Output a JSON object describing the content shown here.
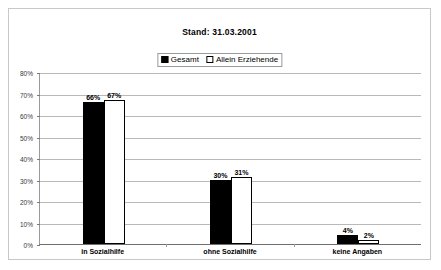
{
  "chart_data": {
    "type": "bar",
    "title": "Stand: 31.03.2001",
    "xlabel": "",
    "ylabel": "",
    "ylim": [
      0,
      80
    ],
    "ytick_labels": [
      "80%",
      "70%",
      "60%",
      "50%",
      "40%",
      "30%",
      "20%",
      "10%",
      "0%"
    ],
    "ytick_values": [
      80,
      70,
      60,
      50,
      40,
      30,
      20,
      10,
      0
    ],
    "grid": true,
    "legend_position": "top-center",
    "categories": [
      "in Sozialhilfe",
      "ohne Sozialhilfe",
      "keine Angaben"
    ],
    "series": [
      {
        "name": "Gesamt",
        "color": "#000000",
        "style": "filled",
        "values": [
          66,
          30,
          4
        ],
        "labels": [
          "66%",
          "30%",
          "4%"
        ]
      },
      {
        "name": "Allein Erziehende",
        "color": "#ffffff",
        "style": "hollow",
        "values": [
          67,
          31,
          2
        ],
        "labels": [
          "67%",
          "31%",
          "2%"
        ]
      }
    ]
  },
  "colors": {
    "frame_border": "#c8c8c8",
    "gridline": "#b9b9b9",
    "axis": "#6f6f6f",
    "series_gesamt": "#000000",
    "series_allein": "#ffffff",
    "text": "#000000"
  }
}
